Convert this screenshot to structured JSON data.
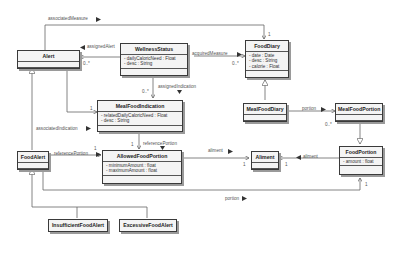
{
  "diagram": {
    "type": "UML class diagram",
    "classes": [
      {
        "id": "alert",
        "name": "Alert",
        "attributes": []
      },
      {
        "id": "wellness",
        "name": "WellnessStatus",
        "attributes": [
          "- dailyCaloricNeed : Float",
          "- desc : String"
        ]
      },
      {
        "id": "fooddiary",
        "name": "FoodDiary",
        "attributes": [
          "- date : Date",
          "- desc : String",
          "- calorie : Float"
        ]
      },
      {
        "id": "mealind",
        "name": "MealFoodIndication",
        "attributes": [
          "- relatedDailyCaloricNeed : Float",
          "- desc : String"
        ]
      },
      {
        "id": "mealdiary",
        "name": "MealFoodDiary",
        "attributes": []
      },
      {
        "id": "mealportion",
        "name": "MealFoodPortion",
        "attributes": []
      },
      {
        "id": "foodalert",
        "name": "FoodAlert",
        "attributes": []
      },
      {
        "id": "allowed",
        "name": "AllowedFoodPortion",
        "attributes": [
          "- minimumAmount : float",
          "- maximumAmount : float"
        ]
      },
      {
        "id": "aliment",
        "name": "Aliment",
        "attributes": []
      },
      {
        "id": "foodportion",
        "name": "FoodPortion",
        "attributes": [
          "- amount : float"
        ]
      },
      {
        "id": "insufficient",
        "name": "InsufficientFoodAlert",
        "attributes": []
      },
      {
        "id": "excessive",
        "name": "ExcessiveFoodAlert",
        "attributes": []
      }
    ],
    "associations": [
      {
        "label": "associatedMeasure",
        "from": "Alert",
        "to": "FoodDiary",
        "mult_to": "1"
      },
      {
        "label": "assignedAlert",
        "from": "WellnessStatus",
        "to": "Alert",
        "mult_to": "0..*"
      },
      {
        "label": "acquiredMeasure",
        "from": "WellnessStatus",
        "to": "FoodDiary",
        "mult_to": "0..*"
      },
      {
        "label": "assignedIndication",
        "from": "WellnessStatus",
        "to": "MealFoodIndication",
        "mult_to": "0..*"
      },
      {
        "label": "associatedIndication",
        "from": "Alert",
        "to": "MealFoodIndication",
        "mult_to": "1"
      },
      {
        "label": "referencePortion",
        "from": "MealFoodIndication",
        "to": "AllowedFoodPortion",
        "mult_to": "1"
      },
      {
        "label": "referencePortion",
        "from": "FoodAlert",
        "to": "AllowedFoodPortion",
        "mult_to": "1"
      },
      {
        "label": "aliment",
        "from": "AllowedFoodPortion",
        "to": "Aliment",
        "mult_to": "1"
      },
      {
        "label": "aliment",
        "from": "FoodPortion",
        "to": "Aliment",
        "mult_to": "1"
      },
      {
        "label": "portion",
        "from": "MealFoodDiary",
        "to": "MealFoodPortion",
        "mult_to": "0..*"
      },
      {
        "label": "portion",
        "from": "FoodAlert",
        "to": "FoodPortion",
        "mult_to": "1"
      }
    ],
    "generalizations": [
      {
        "child": "FoodAlert",
        "parent": "Alert"
      },
      {
        "child": "InsufficientFoodAlert",
        "parent": "FoodAlert"
      },
      {
        "child": "ExcessiveFoodAlert",
        "parent": "FoodAlert"
      },
      {
        "child": "MealFoodDiary",
        "parent": "FoodDiary"
      },
      {
        "child": "MealFoodPortion",
        "parent": "FoodPortion"
      }
    ]
  },
  "labels": {
    "associatedMeasure": "associatedMeasure",
    "assignedAlert": "assignedAlert",
    "acquiredMeasure": "acquiredMeasure",
    "assignedIndication": "assignedIndication",
    "associatedIndication": "associatedIndication",
    "referencePortion1": "referencePortion",
    "referencePortion2": "referencePortion",
    "aliment1": "aliment",
    "aliment2": "aliment",
    "portion1": "portion",
    "portion2": "portion"
  },
  "multiplicities": {
    "m_diary_top": "1",
    "m_alert_assigned": "0..*",
    "m_diary_acquired": "0..*",
    "m_ind_assigned": "0..*",
    "m_ind_assoc": "1",
    "m_allowed_ref": "1",
    "m_allowed_fa": "1",
    "m_aliment1": "1",
    "m_aliment2": "1",
    "m_mealportion": "0..*",
    "m_foodportion": "1"
  }
}
